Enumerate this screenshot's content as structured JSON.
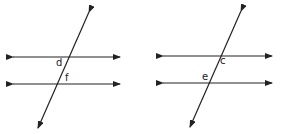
{
  "figures": [
    {
      "name": "left-figure",
      "parallel_lines": [
        {
          "x1": 13,
          "y1": 57,
          "x2": 120,
          "y2": 57
        },
        {
          "x1": 13,
          "y1": 84,
          "x2": 120,
          "y2": 84
        }
      ],
      "transversal": {
        "x1": 89,
        "y1": 12,
        "x2": 38,
        "y2": 128
      },
      "labels": [
        {
          "text": "d",
          "x": 56,
          "y": 66
        },
        {
          "text": "f",
          "x": 65,
          "y": 81
        }
      ]
    },
    {
      "name": "right-figure",
      "parallel_lines": [
        {
          "x1": 163,
          "y1": 56,
          "x2": 272,
          "y2": 56
        },
        {
          "x1": 163,
          "y1": 83,
          "x2": 272,
          "y2": 83
        }
      ],
      "transversal": {
        "x1": 241,
        "y1": 11,
        "x2": 190,
        "y2": 127
      },
      "labels": [
        {
          "text": "c",
          "x": 220,
          "y": 64
        },
        {
          "text": "e",
          "x": 202,
          "y": 80
        }
      ]
    }
  ],
  "colors": {
    "line": "#222222",
    "background": "#ffffff"
  }
}
